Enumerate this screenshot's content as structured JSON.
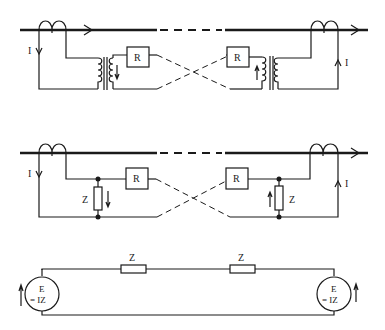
{
  "diagram": {
    "type": "protection-circuit-schematic",
    "panels": [
      {
        "id": "top",
        "description": "Pilot-wire differential scheme with current transformers and isolating transformers",
        "labels": {
          "current_left": "I",
          "current_right": "I",
          "relay_left": "R",
          "relay_right": "R"
        }
      },
      {
        "id": "middle",
        "description": "Pilot-wire scheme with impedance Z across secondary",
        "labels": {
          "current_left": "I",
          "current_right": "I",
          "relay_left": "R",
          "relay_right": "R",
          "impedance_left": "Z",
          "impedance_right": "Z"
        }
      },
      {
        "id": "bottom",
        "description": "Equivalent circuit with two voltage sources and series impedances",
        "labels": {
          "impedance_left": "Z",
          "impedance_right": "Z",
          "source_left_line1": "E",
          "source_left_line2": "= IZ",
          "source_right_line1": "E",
          "source_right_line2": "= IZ"
        }
      }
    ]
  }
}
